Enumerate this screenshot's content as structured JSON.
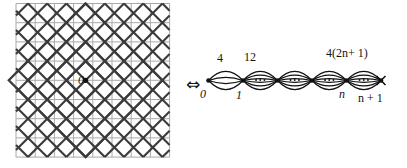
{
  "figure": {
    "equivalence_symbol": "⇔",
    "left_panel": {
      "name": "taxicab-grid-diagram",
      "center_label": "0",
      "description": "square lattice grid with concentric diamond spheres and diagonal lines",
      "grid": {
        "columns": 8,
        "rows": 8,
        "spacing": 19.2,
        "x0": 16,
        "y0": 3.5,
        "line_color": "#a9a9a9",
        "line_width": 1.0
      },
      "diamonds": [
        {
          "radius_cells": 1
        },
        {
          "radius_cells": 2
        },
        {
          "radius_cells": 3
        },
        {
          "radius_cells": 4
        }
      ],
      "diagonal_color": "#3a3a3a",
      "diagonal_width": 2.1,
      "center_dot": {
        "x": 85.6,
        "y": 80.3,
        "r": 2.6,
        "color": "#111111"
      }
    },
    "right_panel": {
      "name": "multigraph-diagram",
      "vertices": [
        {
          "id": "v0",
          "label": "0",
          "x": 208.5,
          "y": 80.5
        },
        {
          "id": "v1",
          "label": "1",
          "x": 243.0,
          "y": 80.5
        },
        {
          "id": "v2",
          "label": "",
          "x": 277.5,
          "y": 80.5
        },
        {
          "id": "v3",
          "label": "",
          "x": 312.0,
          "y": 80.5
        },
        {
          "id": "vn",
          "label": "n",
          "x": 346.5,
          "y": 80.5
        },
        {
          "id": "vn1",
          "label": "n + 1",
          "x": 381.0,
          "y": 80.5
        }
      ],
      "edge_bundles": [
        {
          "from": "v0",
          "to": "v1",
          "multiplicity_label": "4",
          "arcs": 4,
          "dots": false
        },
        {
          "from": "v1",
          "to": "v2",
          "multiplicity_label": "12",
          "arcs": 6,
          "dots": true
        },
        {
          "from": "v2",
          "to": "v3",
          "multiplicity_label": "",
          "arcs": 6,
          "dots": true
        },
        {
          "from": "v3",
          "to": "vn",
          "multiplicity_label": "",
          "arcs": 6,
          "dots": true
        },
        {
          "from": "vn",
          "to": "vn1",
          "multiplicity_label": "4(2n + 1)",
          "arcs": 6,
          "dots": true
        }
      ],
      "terminal_cross": {
        "x": 381.0,
        "y": 80.5,
        "size": 9
      },
      "vertex_labels": {
        "first": "0",
        "second": "1",
        "nth": "n",
        "last_prefix": "n",
        "last_suffix": "+ 1",
        "last_full": "n + 1"
      },
      "multiplicity_labels": {
        "first": "4",
        "second": "12",
        "general_prefix": "4(2",
        "general_var": "n",
        "general_suffix": "+ 1)",
        "general_full": "4(2n + 1)"
      },
      "edge_color": "#111111",
      "edge_width": 1.25,
      "vertex_color": "#111111"
    }
  },
  "colors": {
    "background": "#ffffff",
    "grid": "#a9a9a9",
    "diagonal": "#3a3a3a",
    "ink": "#141414"
  }
}
